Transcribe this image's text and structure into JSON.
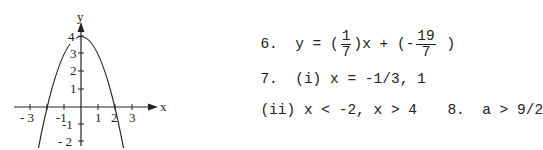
{
  "graph": {
    "function": "y = 4 - x^2",
    "axis_labels": {
      "x": "x",
      "y": "y"
    },
    "x_ticks": [
      "- 3",
      "-1",
      "1",
      "2",
      "3"
    ],
    "y_ticks": [
      "4",
      "3",
      "2",
      "1",
      "-1",
      "- 2"
    ]
  },
  "answers": {
    "q6": {
      "number": "6.",
      "prefix": "y = (",
      "frac1_num": "1",
      "frac1_den": "7",
      "middle": ")x + (-",
      "frac2_num": "19",
      "frac2_den": "7",
      "suffix": ")"
    },
    "q7": {
      "number": "7.",
      "part_i": "(i) x = -1/3, 1",
      "part_ii": "(ii) x < -2, x > 4"
    },
    "q8": {
      "number": "8.",
      "text": "a > 9/2"
    }
  }
}
